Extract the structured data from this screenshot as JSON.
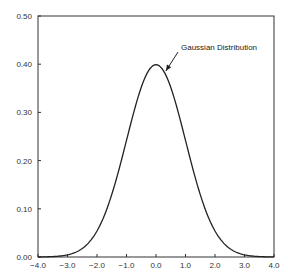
{
  "chart_data": {
    "type": "line",
    "title": "",
    "xlabel": "",
    "ylabel": "",
    "xlim": [
      -4.0,
      4.0
    ],
    "ylim": [
      0.0,
      0.5
    ],
    "grid": false,
    "legend": null,
    "x_ticks": [
      "-4.0",
      "-3.0",
      "-2.0",
      "-1.0",
      "0.0",
      "1.0",
      "2.0",
      "3.0",
      "4.0"
    ],
    "y_ticks": [
      "0.00",
      "0.10",
      "0.20",
      "0.30",
      "0.40",
      "0.50"
    ],
    "annotations": [
      {
        "text": "Gaussian Distribution",
        "points_to": {
          "x": 0.3,
          "y": 0.39
        }
      }
    ],
    "series": [
      {
        "name": "Gaussian Distribution",
        "x": [
          -4.0,
          -3.5,
          -3.0,
          -2.5,
          -2.0,
          -1.5,
          -1.0,
          -0.5,
          0.0,
          0.5,
          1.0,
          1.5,
          2.0,
          2.5,
          3.0,
          3.5,
          4.0
        ],
        "values": [
          0.0001,
          0.0009,
          0.0044,
          0.0175,
          0.054,
          0.1295,
          0.242,
          0.3521,
          0.3989,
          0.3521,
          0.242,
          0.1295,
          0.054,
          0.0175,
          0.0044,
          0.0009,
          0.0001
        ]
      }
    ]
  }
}
